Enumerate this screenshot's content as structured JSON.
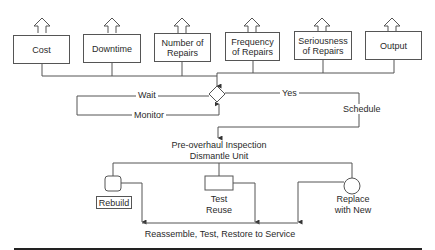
{
  "diagram": {
    "metrics": [
      {
        "label": "Cost"
      },
      {
        "label": "Downtime"
      },
      {
        "label": "Number of\nRepairs"
      },
      {
        "label": "Frequency\nof Repairs"
      },
      {
        "label": "Seriousness\nof Repairs"
      },
      {
        "label": "Output"
      }
    ],
    "decision": {
      "wait_label": "Wait",
      "monitor_label": "Monitor",
      "yes_label": "Yes",
      "schedule_label": "Schedule"
    },
    "inspection": {
      "line1": "Pre-overhaul Inspection",
      "line2": "Dismantle Unit"
    },
    "options": {
      "rebuild": "Rebuild",
      "test_line1": "Test",
      "test_line2": "Reuse",
      "replace_line1": "Replace",
      "replace_line2": "with New"
    },
    "final_step": "Reassemble, Test, Restore to Service"
  }
}
